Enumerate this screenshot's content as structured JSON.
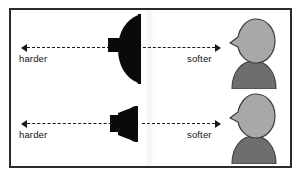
{
  "figure": {
    "background_color": "#ffffff",
    "border_color": "#2b2b2b",
    "line_color": "#1a1a1a",
    "speaker_color": "#0a0a0a",
    "head_color": "#a8a8a8",
    "body_color": "#6e6e6e",
    "outline_color": "#3c3c3c"
  },
  "rows": [
    {
      "id": "wide-dispersion",
      "left_label": "harder",
      "right_label": "softer",
      "speaker_name": "wide-dispersion-speaker",
      "listener_name": "listener-figure"
    },
    {
      "id": "narrow-dispersion",
      "left_label": "harder",
      "right_label": "softer",
      "speaker_name": "narrow-dispersion-speaker",
      "listener_name": "listener-figure"
    }
  ]
}
